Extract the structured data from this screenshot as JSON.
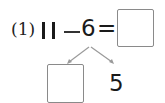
{
  "problem": {
    "label": "(1)",
    "operand_a": "11",
    "operator": "−",
    "operand_b": "6",
    "equals": "=",
    "answer_box": "",
    "decomposition": {
      "left_box": "",
      "right_value": "5"
    }
  },
  "colors": {
    "text": "#1a1a1a",
    "box_border": "#8a8a8a",
    "arrow": "#9a9a9a"
  }
}
